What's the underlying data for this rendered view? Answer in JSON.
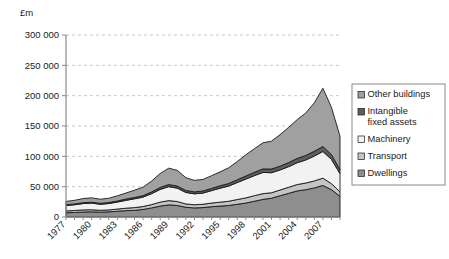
{
  "chart_data": {
    "type": "area",
    "title": "",
    "subtitle": "",
    "unit_label": "£m",
    "xlabel": "",
    "ylabel": "",
    "ylim": [
      0,
      300000
    ],
    "ytick_step": 50000,
    "ytick_labels": [
      "300 000",
      "250 000",
      "200 000",
      "150 000",
      "100 000",
      "50 000",
      "0"
    ],
    "ytick_values": [
      300000,
      250000,
      200000,
      150000,
      100000,
      50000,
      0
    ],
    "grid": true,
    "grid_axis": "y",
    "legend_position": "right",
    "stacked": true,
    "stack_order_bottom_to_top": [
      "Dwellings",
      "Transport",
      "Machinery",
      "Intangible fixed assets",
      "Other buildings"
    ],
    "x": [
      1977,
      1978,
      1979,
      1980,
      1981,
      1982,
      1983,
      1984,
      1985,
      1986,
      1987,
      1988,
      1989,
      1990,
      1991,
      1992,
      1993,
      1994,
      1995,
      1996,
      1997,
      1998,
      1999,
      2000,
      2001,
      2002,
      2003,
      2004,
      2005,
      2006,
      2007,
      2008,
      2009
    ],
    "xtick_labels": [
      "1977",
      "1980",
      "1983",
      "1986",
      "1989",
      "1992",
      "1995",
      "1998",
      "2001",
      "2004",
      "2007"
    ],
    "xtick_values": [
      1977,
      1980,
      1983,
      1986,
      1989,
      1992,
      1995,
      1998,
      2001,
      2004,
      2007
    ],
    "xtick_label_rotation": -45,
    "series": [
      {
        "name": "Dwellings",
        "color": "#8e8e8e",
        "values": [
          7000,
          7500,
          8200,
          8500,
          8000,
          8500,
          9500,
          10500,
          11000,
          12500,
          15000,
          18000,
          20000,
          19000,
          16000,
          15000,
          15500,
          17000,
          18000,
          19000,
          21000,
          23000,
          26000,
          29000,
          31000,
          35000,
          39000,
          43000,
          45000,
          48000,
          52000,
          45000,
          34000
        ]
      },
      {
        "name": "Transport",
        "color": "#c4c4c4",
        "values": [
          3000,
          3200,
          3500,
          3400,
          3000,
          3200,
          3600,
          4000,
          4500,
          4800,
          5500,
          6500,
          7000,
          6500,
          5500,
          5200,
          5500,
          6000,
          6500,
          7000,
          7800,
          8500,
          9200,
          9500,
          9000,
          9500,
          10000,
          10500,
          11000,
          11500,
          12000,
          10000,
          7500
        ]
      },
      {
        "name": "Machinery",
        "color": "#f2f2f2",
        "values": [
          9000,
          9500,
          10500,
          11000,
          10000,
          10500,
          11500,
          13000,
          14500,
          15500,
          18000,
          21000,
          23000,
          22000,
          19000,
          18000,
          18500,
          20500,
          23000,
          25000,
          28000,
          31000,
          33000,
          35000,
          33000,
          33000,
          34000,
          36000,
          38000,
          41000,
          44000,
          40000,
          30000
        ]
      },
      {
        "name": "Intangible fixed assets",
        "color": "#5e5e5e",
        "values": [
          1200,
          1300,
          1400,
          1500,
          1500,
          1600,
          1800,
          2000,
          2200,
          2400,
          2800,
          3200,
          3500,
          3400,
          3200,
          3200,
          3400,
          3600,
          3900,
          4200,
          4600,
          5000,
          5400,
          5800,
          6000,
          6300,
          6700,
          7000,
          7400,
          7800,
          8200,
          7800,
          6500
        ]
      },
      {
        "name": "Other buildings",
        "color": "#a0a0a0",
        "values": [
          5500,
          6000,
          6800,
          7200,
          6800,
          7200,
          8500,
          10000,
          12000,
          14000,
          18000,
          23000,
          27000,
          26000,
          21000,
          19000,
          19000,
          21000,
          23000,
          26000,
          30000,
          35000,
          39000,
          43000,
          46000,
          52000,
          58000,
          64000,
          70000,
          80000,
          96000,
          78000,
          55000
        ]
      }
    ],
    "legend_entries": [
      {
        "label": "Other buildings",
        "color": "#a0a0a0"
      },
      {
        "label": "Intangible fixed assets",
        "color": "#5e5e5e"
      },
      {
        "label": "Machinery",
        "color": "#f2f2f2"
      },
      {
        "label": "Transport",
        "color": "#c4c4c4"
      },
      {
        "label": "Dwellings",
        "color": "#8e8e8e"
      }
    ],
    "legend_entry_lines": [
      [
        "Other buildings"
      ],
      [
        "Intangible",
        "fixed assets"
      ],
      [
        "Machinery"
      ],
      [
        "Transport"
      ],
      [
        "Dwellings"
      ]
    ]
  }
}
